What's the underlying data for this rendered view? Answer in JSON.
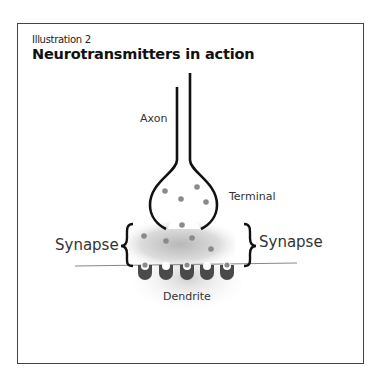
{
  "illustration": {
    "subtitle": "Illustration 2",
    "title": "Neurotransmitters in action"
  },
  "labels": {
    "axon": "Axon",
    "terminal": "Terminal",
    "synapse_left": "Synapse",
    "synapse_right": "Synapse",
    "dendrite": "Dendrite"
  },
  "colors": {
    "outline": "#111111",
    "vesicle_dot": "#8a8a8a",
    "receptor": "#4a4a4a",
    "frame": "#444444"
  }
}
